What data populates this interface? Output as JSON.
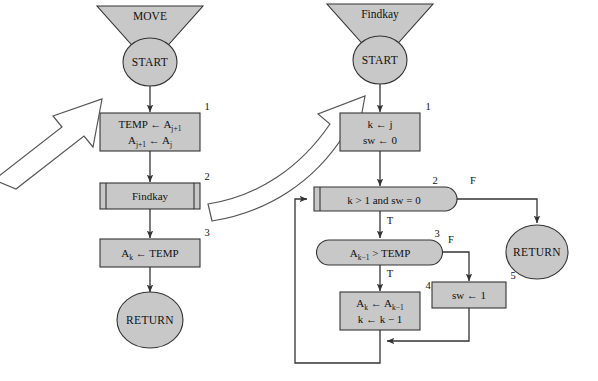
{
  "diagram": {
    "background_color": "#ffffff",
    "shape_fill": "#c8c8c8",
    "shape_stroke": "#333333",
    "connector_color": "#333333",
    "callout_arrow_fill": "#ffffff"
  },
  "left_chart": {
    "title": "MOVE",
    "start_label": "START",
    "return_label": "RETURN",
    "steps": [
      {
        "number": "1",
        "kind": "process",
        "line1": "TEMP ← A",
        "line1_sub": "j+1",
        "line2_a": "A",
        "line2_a_sub": "j+1",
        "line2_mid": " ← A",
        "line2_b_sub": "j"
      },
      {
        "number": "2",
        "kind": "predefined-process",
        "label": "Findkay"
      },
      {
        "number": "3",
        "kind": "process",
        "line1_a": "A",
        "line1_a_sub": "k",
        "line1_rest": " ← TEMP"
      }
    ]
  },
  "right_chart": {
    "title": "Findkay",
    "start_label": "START",
    "return_label": "RETURN",
    "steps": [
      {
        "number": "1",
        "kind": "process",
        "line1": "k ← j",
        "line2": "sw ← 0"
      },
      {
        "number": "2",
        "kind": "loop-test",
        "label": "k > 1 and sw = 0",
        "true_flag": "T",
        "false_flag": "F"
      },
      {
        "number": "3",
        "kind": "decision",
        "label_a": "A",
        "label_a_sub": "k−1",
        "label_rest": " > TEMP",
        "true_flag": "T",
        "false_flag": "F"
      },
      {
        "number": "4",
        "kind": "process",
        "line1_a": "A",
        "line1_a_sub": "k",
        "line1_mid": " ← A",
        "line1_b_sub": "k−1",
        "line2": "k ← k − 1"
      },
      {
        "number": "5",
        "kind": "process",
        "line1": "sw ← 1"
      }
    ]
  }
}
